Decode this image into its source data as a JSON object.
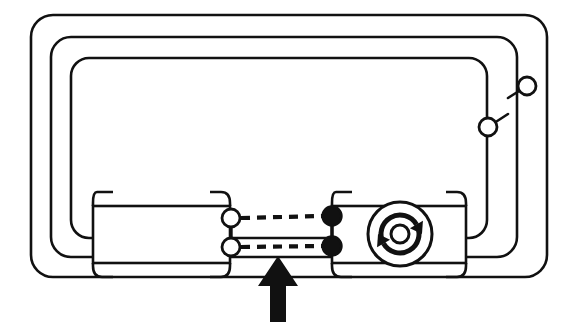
{
  "figure": {
    "title": "Connector interface schematic",
    "background_color": "#ffffff",
    "stroke_color": "#111111",
    "fill_color": "#ffffff",
    "accent_fill": "#111111",
    "width": 563,
    "height": 331
  },
  "nested_loops": [
    {
      "name": "outer-loop",
      "x": 31,
      "y": 15,
      "width": 516,
      "height": 262,
      "radius": 22,
      "stroke_width": 2.6
    },
    {
      "name": "middle-loop",
      "x": 51,
      "y": 37,
      "width": 466,
      "height": 220,
      "radius": 20,
      "stroke_width": 2.6
    },
    {
      "name": "inner-loop",
      "x": 71,
      "y": 58,
      "width": 416,
      "height": 180,
      "radius": 18,
      "stroke_width": 2.6
    }
  ],
  "modules": {
    "left": {
      "name": "left-module",
      "label": "left connector body",
      "x": 93,
      "y": 206,
      "width": 137,
      "height": 57,
      "corner_bracket_length": 20,
      "corner_bracket_radius": 9
    },
    "right": {
      "name": "right-module",
      "label": "right connector body",
      "x": 332,
      "y": 206,
      "width": 134,
      "height": 57,
      "corner_bracket_length": 20,
      "corner_bracket_radius": 9
    }
  },
  "rotation_symbol": {
    "name": "rotation-icon",
    "label": "rotary motion indicator",
    "center_x": 400,
    "center_y": 234,
    "outer_radius": 32,
    "hub_radius": 9,
    "arc_radius": 19,
    "arrow_count": 2,
    "direction": "clockwise"
  },
  "connectors": {
    "hollow": [
      {
        "name": "left-pin-upper",
        "cx": 231,
        "cy": 218,
        "r": 9,
        "style": "hollow"
      },
      {
        "name": "left-pin-lower",
        "cx": 231,
        "cy": 247,
        "r": 9,
        "style": "hollow"
      }
    ],
    "filled": [
      {
        "name": "right-pin-upper",
        "cx": 332,
        "cy": 216,
        "r": 9.5,
        "style": "filled"
      },
      {
        "name": "right-pin-lower",
        "cx": 332,
        "cy": 246,
        "r": 9.5,
        "style": "filled"
      }
    ],
    "bridge_lines": [
      {
        "name": "left-pin-bridge",
        "x": 231,
        "y1": 227,
        "y2": 238
      },
      {
        "name": "right-pin-bridge",
        "x": 332,
        "y1": 225,
        "y2": 237
      }
    ]
  },
  "dashed_links": [
    {
      "name": "dashed-link-upper",
      "x1": 241,
      "y1": 218,
      "x2": 323,
      "y2": 216,
      "dash": "9 7"
    },
    {
      "name": "dashed-link-lower",
      "x1": 241,
      "y1": 247,
      "x2": 323,
      "y2": 246,
      "dash": "9 7"
    }
  ],
  "switch_nodes": [
    {
      "name": "switch-node-upper",
      "cx": 527,
      "cy": 86,
      "r": 9,
      "style": "hollow",
      "lead_from_x": 508,
      "lead_from_y": 98
    },
    {
      "name": "switch-node-lower",
      "cx": 488,
      "cy": 127,
      "r": 9,
      "style": "hollow",
      "lead_from_x": 508,
      "lead_from_y": 114
    }
  ],
  "callout_arrow": {
    "name": "callout-arrow",
    "label": "insertion direction arrow",
    "direction": "up",
    "tip_x": 278,
    "tip_y": 256,
    "tail_y": 322,
    "shaft_half_width": 8,
    "head_half_width": 20,
    "head_height": 30,
    "fill": "#111111"
  }
}
